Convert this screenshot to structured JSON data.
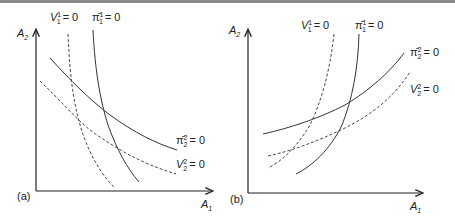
{
  "figure": {
    "panels": [
      {
        "id": "a",
        "tag": "(a)",
        "x_axis": {
          "label": "A",
          "sub": "1"
        },
        "y_axis": {
          "label": "A",
          "sub": "2"
        },
        "curves": [
          {
            "name": "V11",
            "base": "V",
            "sup": "1",
            "sub": "1",
            "eq": "= 0",
            "style": "dashed"
          },
          {
            "name": "pi11",
            "base": "π̄",
            "sup": "1",
            "sub": "1",
            "eq": "= 0",
            "style": "solid"
          },
          {
            "name": "pi22",
            "base": "π̄",
            "sup": "2",
            "sub": "2",
            "eq": "= 0",
            "style": "solid"
          },
          {
            "name": "V22",
            "base": "V",
            "sup": "2",
            "sub": "2",
            "eq": "= 0",
            "style": "dashed"
          }
        ]
      },
      {
        "id": "b",
        "tag": "(b)",
        "x_axis": {
          "label": "A",
          "sub": "1"
        },
        "y_axis": {
          "label": "A",
          "sub": "2"
        },
        "curves": [
          {
            "name": "V11",
            "base": "V",
            "sup": "1",
            "sub": "1",
            "eq": "= 0",
            "style": "dashed"
          },
          {
            "name": "pi11",
            "base": "π̄",
            "sup": "1",
            "sub": "1",
            "eq": "= 0",
            "style": "solid"
          },
          {
            "name": "pi22",
            "base": "π̄",
            "sup": "2",
            "sub": "2",
            "eq": "= 0",
            "style": "solid"
          },
          {
            "name": "V22",
            "base": "V",
            "sup": "2",
            "sub": "2",
            "eq": "= 0",
            "style": "dashed"
          }
        ]
      }
    ],
    "colors": {
      "line": "#2a2a2a",
      "border": "#8a8a8a"
    }
  }
}
